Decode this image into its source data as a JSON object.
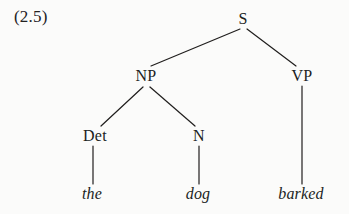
{
  "figure": {
    "example_number": "(2.5)",
    "caption": "",
    "background_color": "#fbfbfa",
    "ink_color": "#201e1d"
  },
  "tree": {
    "type": "syntax-tree",
    "nodes": [
      {
        "id": "S",
        "label": "S",
        "kind": "nonterminal",
        "x": 243,
        "y": 19
      },
      {
        "id": "NP",
        "label": "NP",
        "kind": "nonterminal",
        "x": 146,
        "y": 76
      },
      {
        "id": "VP",
        "label": "VP",
        "kind": "nonterminal",
        "x": 302,
        "y": 76
      },
      {
        "id": "Det",
        "label": "Det",
        "kind": "nonterminal",
        "x": 95,
        "y": 136
      },
      {
        "id": "N",
        "label": "N",
        "kind": "nonterminal",
        "x": 199,
        "y": 136
      },
      {
        "id": "the",
        "label": "the",
        "kind": "terminal",
        "x": 92,
        "y": 194
      },
      {
        "id": "dog",
        "label": "dog",
        "kind": "terminal",
        "x": 198,
        "y": 194
      },
      {
        "id": "barked",
        "label": "barked",
        "kind": "terminal",
        "x": 301,
        "y": 194
      }
    ],
    "edges": [
      {
        "from": "S",
        "to": "NP",
        "x1": 240,
        "y1": 29,
        "x2": 151,
        "y2": 66
      },
      {
        "from": "S",
        "to": "VP",
        "x1": 247,
        "y1": 29,
        "x2": 296,
        "y2": 66
      },
      {
        "from": "NP",
        "to": "Det",
        "x1": 143,
        "y1": 87,
        "x2": 101,
        "y2": 126
      },
      {
        "from": "NP",
        "to": "N",
        "x1": 150,
        "y1": 87,
        "x2": 195,
        "y2": 126
      },
      {
        "from": "Det",
        "to": "the",
        "x1": 93,
        "y1": 146,
        "x2": 93,
        "y2": 184
      },
      {
        "from": "N",
        "to": "dog",
        "x1": 199,
        "y1": 146,
        "x2": 199,
        "y2": 184
      },
      {
        "from": "VP",
        "to": "barked",
        "x1": 302,
        "y1": 86,
        "x2": 302,
        "y2": 184
      }
    ],
    "sentence": "the dog barked",
    "bracketed": "[S [NP [Det the] [N dog]] [VP barked]]"
  }
}
